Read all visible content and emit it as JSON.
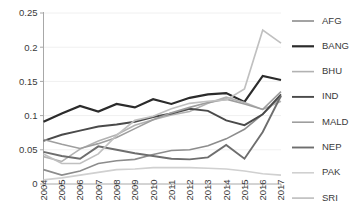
{
  "chart_data": {
    "type": "line",
    "title": "",
    "xlabel": "",
    "ylabel": "",
    "x": [
      2004,
      2005,
      2006,
      2007,
      2008,
      2009,
      2010,
      2011,
      2012,
      2013,
      2014,
      2015,
      2016,
      2017
    ],
    "xtick_labels": [
      "2004",
      "2005",
      "2006",
      "2007",
      "2008",
      "2009",
      "2010",
      "2011",
      "2012",
      "2013",
      "2014",
      "2015",
      "2016",
      "2017"
    ],
    "ytick_labels": [
      "0",
      "0.05",
      "0.1",
      "0.15",
      "0.2",
      "0.25"
    ],
    "ytick_values": [
      0,
      0.05,
      0.1,
      0.15,
      0.2,
      0.25
    ],
    "ylim": [
      0,
      0.25
    ],
    "xlim": [
      2004,
      2017
    ],
    "grid": false,
    "legend_position": "right",
    "series": [
      {
        "name": "AFG",
        "color": "#8c8c8c",
        "width": 1.6,
        "values": [
          0.021,
          0.013,
          0.019,
          0.03,
          0.034,
          0.036,
          0.043,
          0.049,
          0.05,
          0.056,
          0.066,
          0.08,
          0.102,
          0.128
        ]
      },
      {
        "name": "BANG",
        "color": "#2b2b2b",
        "width": 2.2,
        "values": [
          0.091,
          0.103,
          0.114,
          0.106,
          0.117,
          0.112,
          0.124,
          0.117,
          0.126,
          0.131,
          0.133,
          0.12,
          0.158,
          0.152
        ]
      },
      {
        "name": "BHU",
        "color": "#b2b2b2",
        "width": 1.6,
        "values": [
          0.04,
          0.033,
          0.051,
          0.063,
          0.072,
          0.086,
          0.094,
          0.101,
          0.106,
          0.118,
          0.127,
          0.119,
          0.109,
          0.121
        ]
      },
      {
        "name": "IND",
        "color": "#4a4a4a",
        "width": 1.9,
        "values": [
          0.063,
          0.072,
          0.078,
          0.084,
          0.087,
          0.091,
          0.098,
          0.103,
          0.11,
          0.107,
          0.093,
          0.086,
          0.102,
          0.131
        ]
      },
      {
        "name": "MALD",
        "color": "#9e9e9e",
        "width": 1.6,
        "values": [
          0.065,
          0.058,
          0.052,
          0.059,
          0.068,
          0.081,
          0.094,
          0.104,
          0.112,
          0.119,
          0.124,
          0.117,
          0.109,
          0.135
        ]
      },
      {
        "name": "NEP",
        "color": "#6e6e6e",
        "width": 1.9,
        "values": [
          0.047,
          0.041,
          0.037,
          0.055,
          0.05,
          0.045,
          0.041,
          0.037,
          0.036,
          0.039,
          0.057,
          0.037,
          0.076,
          0.129
        ]
      },
      {
        "name": "PAK",
        "color": "#d0d0d0",
        "width": 1.6,
        "values": [
          0.006,
          0.009,
          0.013,
          0.017,
          0.021,
          0.022,
          0.024,
          0.024,
          0.024,
          0.023,
          0.022,
          0.019,
          0.015,
          0.013
        ]
      },
      {
        "name": "SRI",
        "color": "#c0c0c0",
        "width": 1.7,
        "values": [
          0.044,
          0.03,
          0.03,
          0.044,
          0.071,
          0.093,
          0.099,
          0.11,
          0.118,
          0.121,
          0.123,
          0.139,
          0.225,
          0.206
        ]
      }
    ],
    "legend_entries": [
      {
        "label": "AFG",
        "color": "#8c8c8c",
        "width": 1.6
      },
      {
        "label": "BANG",
        "color": "#2b2b2b",
        "width": 2.2
      },
      {
        "label": "BHU",
        "color": "#b2b2b2",
        "width": 1.6
      },
      {
        "label": "IND",
        "color": "#4a4a4a",
        "width": 1.9
      },
      {
        "label": "MALD",
        "color": "#9e9e9e",
        "width": 1.6
      },
      {
        "label": "NEP",
        "color": "#6e6e6e",
        "width": 1.9
      },
      {
        "label": "PAK",
        "color": "#d0d0d0",
        "width": 1.6
      },
      {
        "label": "SRI",
        "color": "#c0c0c0",
        "width": 1.7
      }
    ],
    "axis_color": "#a8a8a8"
  }
}
